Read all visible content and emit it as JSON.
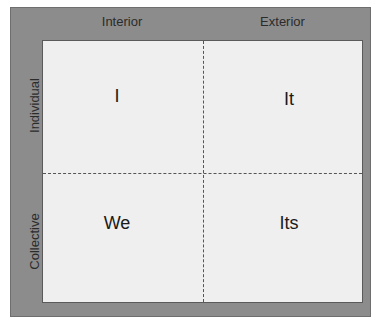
{
  "columns": [
    "Interior",
    "Exterior"
  ],
  "rows": [
    "Individual",
    "Collective"
  ],
  "quadrants": {
    "top_left": "I",
    "top_right": "It",
    "bottom_left": "We",
    "bottom_right": "Its"
  },
  "colors": {
    "frame": "#8c8c8c",
    "panel": "#efefef",
    "text": "#1a1a1a"
  }
}
